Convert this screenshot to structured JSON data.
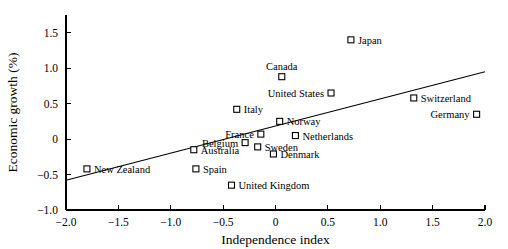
{
  "chart_data": {
    "type": "scatter",
    "title": "",
    "xlabel": "Independence index",
    "ylabel": "Economic growth (%)",
    "xlim": [
      -2.0,
      2.0
    ],
    "ylim": [
      -1.0,
      1.75
    ],
    "grid": false,
    "legend": false,
    "xticks": [
      "-2.0",
      "-1.5",
      "-1.0",
      "-0.5",
      "0",
      "0.5",
      "1.0",
      "1.5",
      "2.0"
    ],
    "xtick_values": [
      -2.0,
      -1.5,
      -1.0,
      -0.5,
      0,
      0.5,
      1.0,
      1.5,
      2.0
    ],
    "yticks": [
      "1.5",
      "1.0",
      "0.5",
      "0",
      "-0.5",
      "-1.0"
    ],
    "ytick_values": [
      1.5,
      1.0,
      0.5,
      0,
      -0.5,
      -1.0
    ],
    "marker": "open-square",
    "points": [
      {
        "label": "Japan",
        "x": 0.72,
        "y": 1.4,
        "label_side": "right"
      },
      {
        "label": "Canada",
        "x": 0.06,
        "y": 0.88,
        "label_side": "above"
      },
      {
        "label": "United States",
        "x": 0.53,
        "y": 0.65,
        "label_side": "left"
      },
      {
        "label": "Switzerland",
        "x": 1.32,
        "y": 0.58,
        "label_side": "right"
      },
      {
        "label": "Italy",
        "x": -0.37,
        "y": 0.42,
        "label_side": "right"
      },
      {
        "label": "Germany",
        "x": 1.92,
        "y": 0.35,
        "label_side": "left"
      },
      {
        "label": "Norway",
        "x": 0.04,
        "y": 0.25,
        "label_side": "right"
      },
      {
        "label": "France",
        "x": -0.14,
        "y": 0.07,
        "label_side": "left"
      },
      {
        "label": "Netherlands",
        "x": 0.19,
        "y": 0.05,
        "label_side": "right"
      },
      {
        "label": "Belgium",
        "x": -0.29,
        "y": -0.05,
        "label_side": "left"
      },
      {
        "label": "Sweden",
        "x": -0.17,
        "y": -0.11,
        "label_side": "right"
      },
      {
        "label": "Australia",
        "x": -0.78,
        "y": -0.15,
        "label_side": "right"
      },
      {
        "label": "Denmark",
        "x": -0.02,
        "y": -0.21,
        "label_side": "right"
      },
      {
        "label": "Spain",
        "x": -0.76,
        "y": -0.42,
        "label_side": "right"
      },
      {
        "label": "New Zealand",
        "x": -1.8,
        "y": -0.42,
        "label_side": "right"
      },
      {
        "label": "United Kingdom",
        "x": -0.42,
        "y": -0.65,
        "label_side": "right"
      }
    ],
    "trend_line": {
      "x_start": -2.0,
      "y_start": -0.58,
      "x_end": 2.0,
      "y_end": 0.95
    }
  }
}
